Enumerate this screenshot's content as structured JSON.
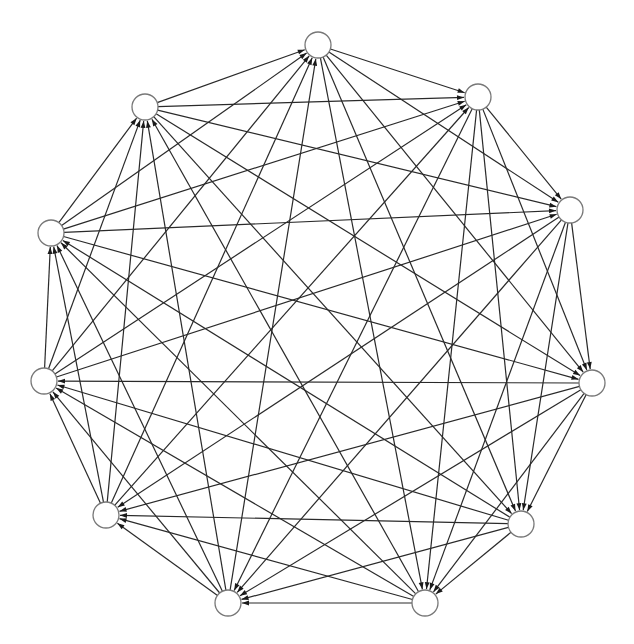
{
  "diagram": {
    "type": "directed-graph",
    "node_radius": 13,
    "colors": {
      "edge": "#2a2a2a",
      "node_stroke": "#777777",
      "node_fill": "#ffffff"
    },
    "nodes": [
      {
        "id": 0,
        "x": 318,
        "y": 45
      },
      {
        "id": 1,
        "x": 478,
        "y": 97
      },
      {
        "id": 2,
        "x": 570,
        "y": 210
      },
      {
        "id": 3,
        "x": 592,
        "y": 383
      },
      {
        "id": 4,
        "x": 521,
        "y": 524
      },
      {
        "id": 5,
        "x": 425,
        "y": 603
      },
      {
        "id": 6,
        "x": 228,
        "y": 603
      },
      {
        "id": 7,
        "x": 106,
        "y": 515
      },
      {
        "id": 8,
        "x": 44,
        "y": 381
      },
      {
        "id": 9,
        "x": 51,
        "y": 233
      },
      {
        "id": 10,
        "x": 145,
        "y": 107
      }
    ],
    "edge_rule": "each node i has an arc to nodes i+1 .. i+5 (mod 11)",
    "out_offsets": [
      1,
      2,
      3,
      4,
      5
    ]
  },
  "caption": ""
}
